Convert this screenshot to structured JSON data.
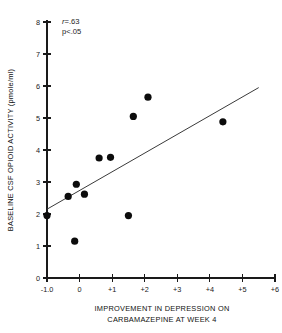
{
  "chart_data": {
    "type": "scatter",
    "title": "",
    "xlabel": "IMPROVEMENT IN DEPRESSION ON CARBAMAZEPINE AT WEEK 4",
    "xlabel_line1": "IMPROVEMENT IN DEPRESSION ON",
    "xlabel_line2": "CARBAMAZEPINE AT WEEK 4",
    "ylabel": "BASELINE CSF OPIOID ACTIVITY (pmole/ml)",
    "xlim": [
      -1.0,
      6.0
    ],
    "ylim": [
      0,
      8
    ],
    "xticks": [
      -1.0,
      0,
      1,
      2,
      3,
      4,
      5,
      6
    ],
    "xticklabels": [
      "-1.0",
      "0",
      "+1",
      "+2",
      "+3",
      "+4",
      "+5",
      "+6"
    ],
    "yticks": [
      0,
      1,
      2,
      3,
      4,
      5,
      6,
      7,
      8
    ],
    "yticklabels": [
      "0",
      "1",
      "2",
      "3",
      "4",
      "5",
      "6",
      "7",
      "8"
    ],
    "grid": false,
    "legend": "none",
    "points": [
      {
        "x": -1.0,
        "y": 1.95
      },
      {
        "x": -0.35,
        "y": 2.55
      },
      {
        "x": -0.15,
        "y": 1.15
      },
      {
        "x": -0.1,
        "y": 2.93
      },
      {
        "x": 0.15,
        "y": 2.62
      },
      {
        "x": 0.6,
        "y": 3.75
      },
      {
        "x": 0.95,
        "y": 3.77
      },
      {
        "x": 1.5,
        "y": 1.95
      },
      {
        "x": 1.65,
        "y": 5.05
      },
      {
        "x": 2.1,
        "y": 5.65
      },
      {
        "x": 4.4,
        "y": 4.88
      }
    ],
    "regression_line": {
      "x1": -1.0,
      "y1": 2.15,
      "x2": 5.5,
      "y2": 5.95
    },
    "annotations": {
      "correlation_symbol": "r",
      "correlation_value": "=.63",
      "significance": "p<.05"
    }
  }
}
